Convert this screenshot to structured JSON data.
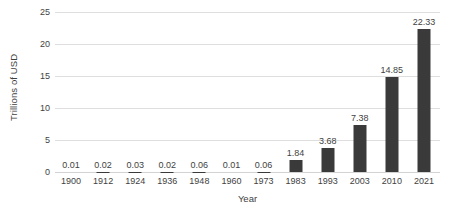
{
  "chart_data": {
    "type": "bar",
    "title": "",
    "xlabel": "Year",
    "ylabel": "Trillions of USD",
    "categories": [
      "1900",
      "1912",
      "1924",
      "1936",
      "1948",
      "1960",
      "1973",
      "1983",
      "1993",
      "2003",
      "2010",
      "2021"
    ],
    "values": [
      0.01,
      0.02,
      0.03,
      0.02,
      0.06,
      0.01,
      0.06,
      1.84,
      3.68,
      7.38,
      14.85,
      22.33
    ],
    "data_labels": [
      "0.01",
      "0.02",
      "0.03",
      "0.02",
      "0.06",
      "0.01",
      "0.06",
      "1.84",
      "3.68",
      "7.38",
      "14.85",
      "22.33"
    ],
    "ylim": [
      0,
      25
    ],
    "yticks": [
      0,
      5,
      10,
      15,
      20,
      25
    ],
    "ytick_labels": [
      "0",
      "5",
      "10",
      "15",
      "20",
      "25"
    ],
    "grid": true,
    "legend": false,
    "bar_color": "#3a3a3a",
    "grid_color": "#dedede",
    "text_color": "#3f3f3f",
    "background": "#ffffff"
  }
}
